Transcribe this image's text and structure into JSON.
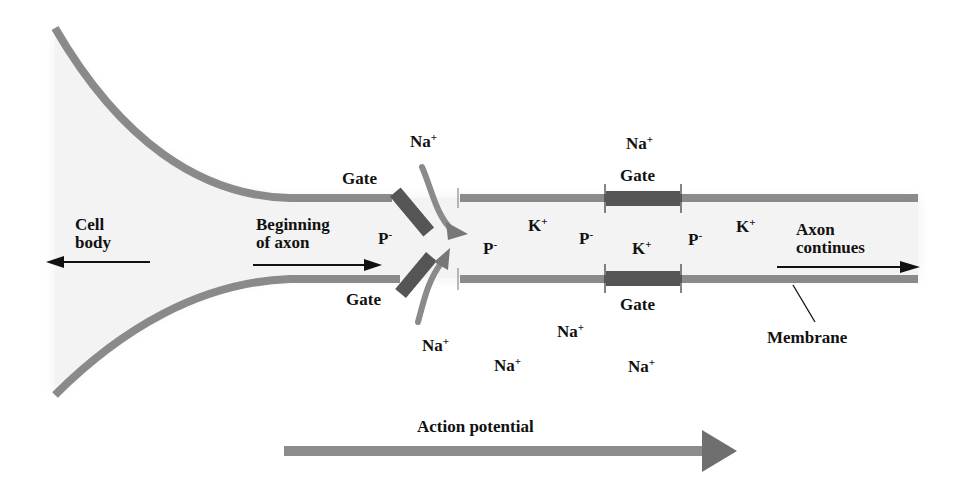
{
  "diagram": {
    "labels": {
      "cell_body": [
        "Cell",
        "body"
      ],
      "beginning_of_axon": [
        "Beginning",
        "of axon"
      ],
      "axon_continues": [
        "Axon",
        "continues"
      ],
      "membrane": "Membrane",
      "action_potential": "Action potential",
      "gate": "Gate"
    },
    "ions": {
      "na": {
        "symbol": "Na",
        "charge": "+"
      },
      "k": {
        "symbol": "K",
        "charge": "+"
      },
      "p": {
        "symbol": "P",
        "charge": "-"
      }
    },
    "gates": [
      {
        "id": "open-gate-top",
        "state": "open",
        "label": "Gate"
      },
      {
        "id": "open-gate-bottom",
        "state": "open",
        "label": "Gate"
      },
      {
        "id": "closed-gate-top",
        "state": "closed",
        "label": "Gate"
      },
      {
        "id": "closed-gate-bottom",
        "state": "closed",
        "label": "Gate"
      }
    ],
    "colors": {
      "membrane": "#8a8a8a",
      "gate": "#555555",
      "arrow": "#777777",
      "shading": "#eeeeee",
      "text": "#111111"
    }
  }
}
